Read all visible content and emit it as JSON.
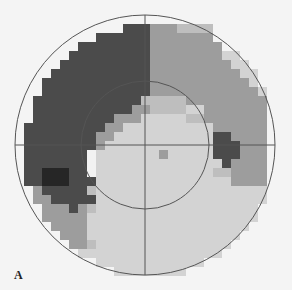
{
  "figure": {
    "panel_label": "A",
    "type": "visual-field-greyscale-map",
    "outer_circle": {
      "cx": 145,
      "cy": 145,
      "r": 130
    },
    "inner_circle": {
      "cx": 145,
      "cy": 145,
      "r": 64
    },
    "crosshair": {
      "cx": 145,
      "cy": 145,
      "extent": 130
    },
    "grid": {
      "origin_x": 15,
      "origin_y": 15,
      "cell": 9,
      "cols": 29,
      "rows": 29
    },
    "palette": {
      "0": "#f0f0f0",
      "1": "#d3d3d3",
      "2": "#bebebe",
      "3": "#9d9d9d",
      "4": "#4b4b4b",
      "5": "#262626",
      "6": "#f2f2f2"
    },
    "rows": [
      "00000000000000000000000000000",
      "00000000000044433322220000000",
      "00000000044444433333330000000",
      "00000004444444433333333000000",
      "00000044444444433333333110000",
      "00000444444444433333333311000",
      "00004444444444433333333331100",
      "00044444444444433333333333110",
      "00044444444444433333333333310",
      "00444444444444222223333333330",
      "00444444444443322221133333330",
      "00444444444333111112233333330",
      "04444444443311111111113333330",
      "04444444433111111111114433330",
      "04444444431111111111114443330",
      "04444444611111113111114443330",
      "04444444611111111111111433330",
      "04455544611111111111112233330",
      "04455544411111111111111133330",
      "00344444211111111111111111110",
      "00334444411111111111111111110",
      "00033343211111111111111111110",
      "00033333111111111111111111100",
      "00003333111111111111111111100",
      "00000333111111111111111111000",
      "00000033211111111111111110000",
      "00000001111111111111111100000",
      "00000000011111111111111000000",
      "00000000000111111111100000000"
    ]
  }
}
